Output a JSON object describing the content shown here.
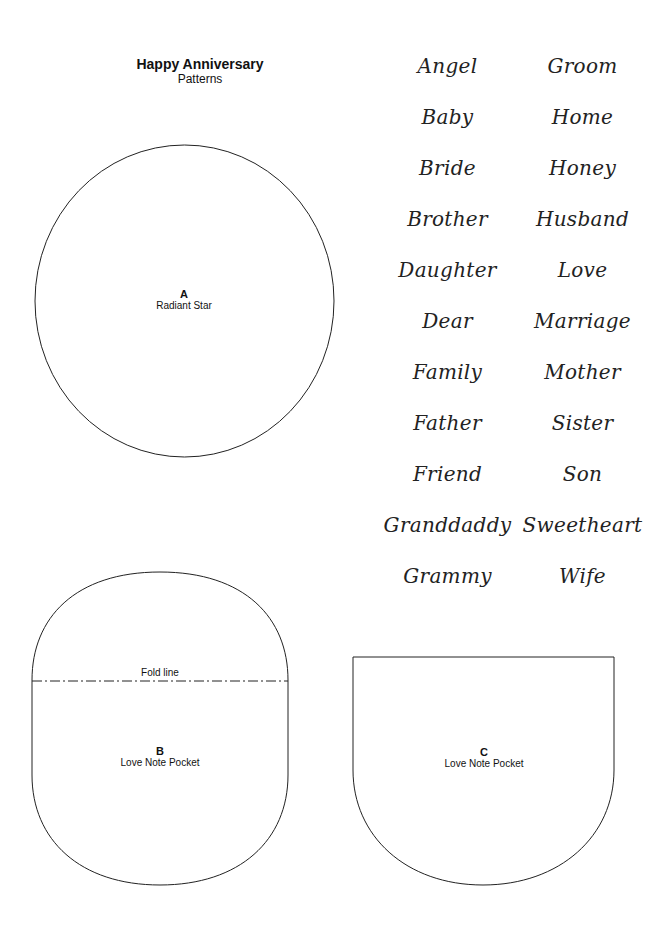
{
  "header": {
    "title": "Happy Anniversary",
    "subtitle": "Patterns"
  },
  "words": {
    "left": [
      "Angel",
      "Baby",
      "Bride",
      "Brother",
      "Daughter",
      "Dear",
      "Family",
      "Father",
      "Friend",
      "Granddaddy",
      "Grammy"
    ],
    "right": [
      "Groom",
      "Home",
      "Honey",
      "Husband",
      "Love",
      "Marriage",
      "Mother",
      "Sister",
      "Son",
      "Sweetheart",
      "Wife"
    ]
  },
  "patterns": {
    "a": {
      "letter": "A",
      "name": "Radiant Star"
    },
    "b": {
      "letter": "B",
      "name": "Love Note Pocket",
      "fold_label": "Fold line"
    },
    "c": {
      "letter": "C",
      "name": "Love Note Pocket"
    }
  },
  "colors": {
    "outline": "#222222",
    "background": "#ffffff"
  }
}
